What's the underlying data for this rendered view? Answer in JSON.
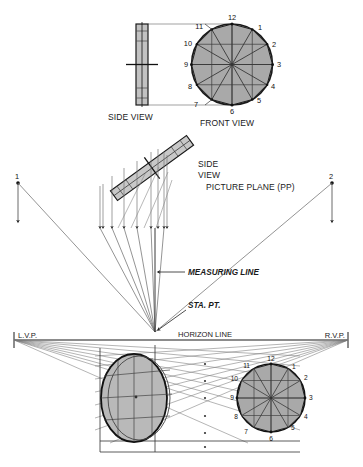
{
  "figure": {
    "title_parts": [
      "SIDE VIEW",
      "FRONT VIEW",
      "PICTURE PLANE (PP)"
    ],
    "colors": {
      "ink": "#1a1a1a",
      "fill_grey": "#b9b9b9",
      "fill_grey_dark": "#a9a9a9",
      "thin_line": "#555555",
      "light_line": "#8a8a8a"
    }
  },
  "top_views": {
    "side_view_label": "SIDE VIEW",
    "front_view_label": "FRONT VIEW",
    "clock_numbers": [
      "12",
      "1",
      "2",
      "3",
      "4",
      "5",
      "6",
      "7",
      "8",
      "9",
      "10",
      "11"
    ]
  },
  "middle": {
    "side_view_label_line1": "SIDE",
    "side_view_label_line2": "VIEW",
    "picture_plane_label": "PICTURE PLANE (PP)",
    "measuring_line_label": "MEASURING LINE",
    "station_point_label": "STA. PT.",
    "left_point_label": "1",
    "right_point_label": "2"
  },
  "horizon": {
    "left_vp_label": "L.V.P.",
    "right_vp_label": "R.V.P.",
    "horizon_label": "HORIZON LINE"
  },
  "bottom": {
    "right_circle_numbers": [
      "12",
      "1",
      "2",
      "3",
      "4",
      "5",
      "6",
      "7",
      "8",
      "9",
      "10",
      "11"
    ],
    "left_ellipse_numbers": []
  }
}
